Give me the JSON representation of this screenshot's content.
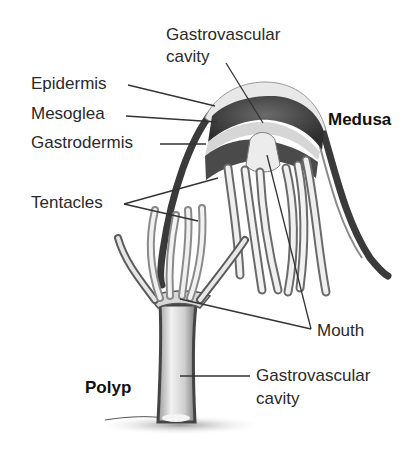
{
  "diagram": {
    "forms": {
      "medusa": "Medusa",
      "polyp": "Polyp"
    },
    "labels": {
      "gastro_cavity_top_line1": "Gastrovascular",
      "gastro_cavity_top_line2": "cavity",
      "epidermis": "Epidermis",
      "mesoglea": "Mesoglea",
      "gastrodermis": "Gastrodermis",
      "tentacles": "Tentacles",
      "mouth": "Mouth",
      "gastro_cavity_bottom_line1": "Gastrovascular",
      "gastro_cavity_bottom_line2": "cavity"
    },
    "colors": {
      "text": "#2a2a2a",
      "leader_line": "#333333",
      "epidermis": "#e6e6e6",
      "mesoglea": "#4a4a4a",
      "gastrodermis": "#d4d4d4",
      "dark_outline": "#3c3c3c"
    }
  }
}
